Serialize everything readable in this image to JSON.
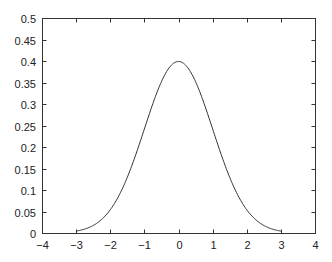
{
  "chart_data": {
    "type": "line",
    "title": "",
    "xlabel": "",
    "ylabel": "",
    "xlim": [
      -4,
      4
    ],
    "ylim": [
      0,
      0.5
    ],
    "grid": false,
    "legend": null,
    "x_ticks": [
      -4,
      -3,
      -2,
      -1,
      0,
      1,
      2,
      3,
      4
    ],
    "x_tick_labels": [
      "−4",
      "−3",
      "−2",
      "−1",
      "0",
      "1",
      "2",
      "3",
      "4"
    ],
    "y_ticks": [
      0,
      0.05,
      0.1,
      0.15,
      0.2,
      0.25,
      0.3,
      0.35,
      0.4,
      0.45,
      0.5
    ],
    "y_tick_labels": [
      "0",
      "0.05",
      "0.1",
      "0.15",
      "0.2",
      "0.25",
      "0.3",
      "0.35",
      "0.4",
      "0.45",
      "0.5"
    ],
    "series": [
      {
        "name": "standard normal pdf",
        "x": [
          -3,
          -2.5,
          -2,
          -1.5,
          -1,
          -0.5,
          0,
          0.5,
          1,
          1.5,
          2,
          2.5,
          3
        ],
        "values": [
          0.0044,
          0.0175,
          0.054,
          0.1295,
          0.242,
          0.3521,
          0.3989,
          0.3521,
          0.242,
          0.1295,
          0.054,
          0.0175,
          0.0044
        ],
        "domain": [
          -3,
          3
        ],
        "color": "#333333"
      }
    ]
  },
  "layout": {
    "plot_left": 42,
    "plot_right": 315,
    "plot_top": 18,
    "plot_bottom": 233
  }
}
